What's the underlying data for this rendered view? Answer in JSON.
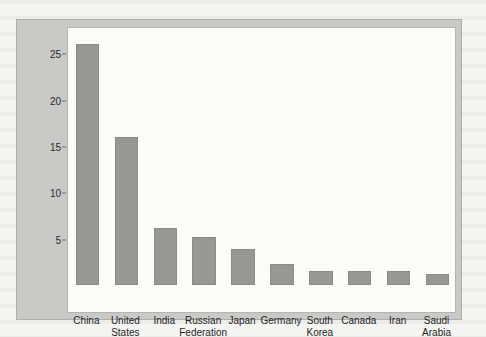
{
  "figure": {
    "background_color": "#c9c9c7",
    "plot_background_color": "#fbfbf9",
    "bar_color": "#979795"
  },
  "chart_data": {
    "type": "bar",
    "title": "",
    "xlabel": "",
    "ylabel": "Percent of Global CO2 Emissions",
    "ylabel_parts": {
      "before": "Percent of Global CO",
      "subscript": "2",
      "after": " Emissions"
    },
    "categories": [
      "China",
      "United States",
      "India",
      "Russian Federation",
      "Japan",
      "Germany",
      "South Korea",
      "Canada",
      "Iran",
      "Saudi Arabia"
    ],
    "category_labels_wrapped": [
      "China",
      "United\nStates",
      "India",
      "Russian\nFederation",
      "Japan",
      "Germany",
      "South\nKorea",
      "Canada",
      "Iran",
      "Saudi\nArabia"
    ],
    "values": [
      26.0,
      16.0,
      6.1,
      5.2,
      3.9,
      2.3,
      1.5,
      1.5,
      1.5,
      1.2
    ],
    "ylim": [
      0,
      27.5
    ],
    "yticks": [
      5,
      10,
      15,
      20,
      25
    ],
    "ytick_labels": [
      "5",
      "10",
      "15",
      "20",
      "25"
    ],
    "grid": false,
    "legend": false
  }
}
